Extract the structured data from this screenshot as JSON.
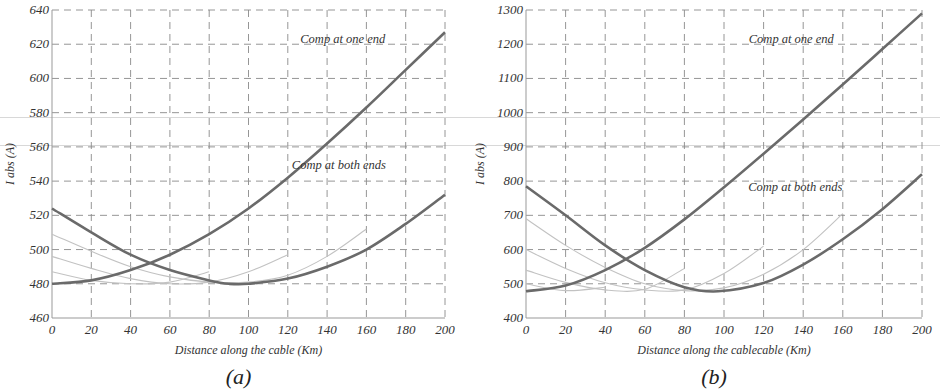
{
  "figure": {
    "scanlines": [
      117,
      145
    ]
  },
  "chart_data": [
    {
      "id": "a",
      "type": "line",
      "caption": "(a)",
      "title": "",
      "xlabel": "Distance along the cable (Km)",
      "ylabel": "I abs (A)",
      "xlim": [
        0,
        200
      ],
      "ylim": [
        460,
        640
      ],
      "xticks": [
        0,
        20,
        40,
        60,
        80,
        100,
        120,
        140,
        160,
        180,
        200
      ],
      "yticks": [
        460,
        480,
        500,
        520,
        540,
        560,
        580,
        600,
        620,
        640
      ],
      "grid": true,
      "annotations": [
        {
          "text": "Comp at one end",
          "x": 148,
          "y": 621
        },
        {
          "text": "Comp at both ends",
          "x": 146,
          "y": 547
        }
      ],
      "series": [
        {
          "name": "Comp at one end",
          "style": "main",
          "x": [
            0,
            20,
            40,
            60,
            80,
            100,
            120,
            140,
            160,
            180,
            200
          ],
          "y": [
            480,
            482,
            488,
            497,
            509,
            524,
            542,
            562,
            583,
            605,
            627
          ]
        },
        {
          "name": "Comp at both ends",
          "style": "main",
          "x": [
            0,
            20,
            40,
            60,
            80,
            90,
            100,
            120,
            140,
            160,
            180,
            200
          ],
          "y": [
            524,
            510,
            497,
            488,
            482,
            480,
            480,
            483,
            490,
            500,
            515,
            532
          ]
        },
        {
          "name": "Intermediate 1",
          "style": "light",
          "x": [
            0,
            20,
            40,
            60,
            80,
            100,
            120,
            140,
            160
          ],
          "y": [
            509,
            499,
            490,
            484,
            481,
            481,
            485,
            496,
            512
          ]
        },
        {
          "name": "Intermediate 2",
          "style": "light",
          "x": [
            0,
            20,
            40,
            60,
            80,
            100,
            120
          ],
          "y": [
            496,
            489,
            483,
            480,
            481,
            487,
            497
          ]
        },
        {
          "name": "Intermediate 3",
          "style": "light",
          "x": [
            0,
            20,
            40,
            60,
            80
          ],
          "y": [
            487,
            482,
            480,
            481,
            487
          ]
        }
      ]
    },
    {
      "id": "b",
      "type": "line",
      "caption": "(b)",
      "title": "",
      "xlabel": "Distance along the cablecable (Km)",
      "ylabel": "I abs (A)",
      "xlim": [
        0,
        200
      ],
      "ylim": [
        400,
        1300
      ],
      "xticks": [
        0,
        20,
        40,
        60,
        80,
        100,
        120,
        140,
        160,
        180,
        200
      ],
      "yticks": [
        400,
        500,
        600,
        700,
        800,
        900,
        1000,
        1100,
        1200,
        1300
      ],
      "grid": true,
      "annotations": [
        {
          "text": "Comp at one end",
          "x": 134,
          "y": 1204
        },
        {
          "text": "Comp at both ends",
          "x": 136,
          "y": 772
        }
      ],
      "series": [
        {
          "name": "Comp at one end",
          "style": "main",
          "x": [
            0,
            20,
            40,
            60,
            80,
            100,
            120,
            140,
            160,
            180,
            200
          ],
          "y": [
            478,
            495,
            540,
            605,
            688,
            782,
            880,
            980,
            1082,
            1186,
            1290
          ]
        },
        {
          "name": "Comp at both ends",
          "style": "main",
          "x": [
            0,
            20,
            40,
            60,
            80,
            97,
            120,
            140,
            160,
            180,
            200
          ],
          "y": [
            785,
            700,
            612,
            540,
            490,
            478,
            502,
            556,
            630,
            718,
            820
          ]
        },
        {
          "name": "Intermediate 1",
          "style": "light",
          "x": [
            0,
            20,
            40,
            60,
            80,
            100,
            120,
            140,
            160
          ],
          "y": [
            690,
            612,
            548,
            500,
            480,
            488,
            528,
            600,
            705
          ]
        },
        {
          "name": "Intermediate 2",
          "style": "light",
          "x": [
            0,
            20,
            40,
            60,
            80,
            100,
            120
          ],
          "y": [
            600,
            545,
            503,
            482,
            482,
            530,
            610
          ]
        },
        {
          "name": "Intermediate 3",
          "style": "light",
          "x": [
            0,
            20,
            40,
            60,
            80
          ],
          "y": [
            540,
            504,
            482,
            484,
            545
          ]
        },
        {
          "name": "Intermediate 4",
          "style": "light",
          "x": [
            0,
            20,
            40
          ],
          "y": [
            500,
            480,
            490
          ]
        }
      ]
    }
  ],
  "panels": [
    {
      "id": "a",
      "caption": "(a)",
      "xlabel": "Distance along the cable (Km)",
      "ylabel": "I abs (A)",
      "annotation_one_end": "Comp at one end",
      "annotation_both_ends": "Comp at both ends"
    },
    {
      "id": "b",
      "caption": "(b)",
      "xlabel": "Distance along the cablecable (Km)",
      "ylabel": "I abs (A)",
      "annotation_one_end": "Comp at one end",
      "annotation_both_ends": "Comp at both ends"
    }
  ]
}
